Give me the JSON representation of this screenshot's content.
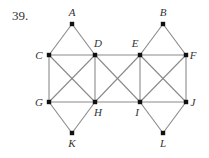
{
  "problem_number": "39.",
  "graph": {
    "edge_color": "#8a8a8a",
    "node_color": "#111111",
    "nodes": [
      {
        "id": "A",
        "x": 72,
        "y": 24,
        "lx": 72,
        "ly": 16
      },
      {
        "id": "B",
        "x": 163,
        "y": 24,
        "lx": 163,
        "ly": 16
      },
      {
        "id": "C",
        "x": 49,
        "y": 55,
        "lx": 39,
        "ly": 59
      },
      {
        "id": "D",
        "x": 95,
        "y": 55,
        "lx": 98,
        "ly": 47
      },
      {
        "id": "E",
        "x": 140,
        "y": 55,
        "lx": 135,
        "ly": 47
      },
      {
        "id": "F",
        "x": 186,
        "y": 55,
        "lx": 193,
        "ly": 59
      },
      {
        "id": "G",
        "x": 49,
        "y": 102,
        "lx": 39,
        "ly": 106
      },
      {
        "id": "H",
        "x": 95,
        "y": 102,
        "lx": 98,
        "ly": 116
      },
      {
        "id": "I",
        "x": 140,
        "y": 102,
        "lx": 137,
        "ly": 116
      },
      {
        "id": "J",
        "x": 186,
        "y": 102,
        "lx": 193,
        "ly": 106
      },
      {
        "id": "K",
        "x": 72,
        "y": 133,
        "lx": 72,
        "ly": 147
      },
      {
        "id": "L",
        "x": 163,
        "y": 133,
        "lx": 163,
        "ly": 147
      }
    ],
    "edges": [
      [
        "A",
        "C"
      ],
      [
        "A",
        "D"
      ],
      [
        "B",
        "E"
      ],
      [
        "B",
        "F"
      ],
      [
        "C",
        "D"
      ],
      [
        "D",
        "E"
      ],
      [
        "E",
        "F"
      ],
      [
        "G",
        "H"
      ],
      [
        "H",
        "I"
      ],
      [
        "I",
        "J"
      ],
      [
        "C",
        "G"
      ],
      [
        "D",
        "H"
      ],
      [
        "E",
        "I"
      ],
      [
        "F",
        "J"
      ],
      [
        "C",
        "H"
      ],
      [
        "D",
        "G"
      ],
      [
        "D",
        "I"
      ],
      [
        "E",
        "H"
      ],
      [
        "E",
        "J"
      ],
      [
        "F",
        "I"
      ],
      [
        "G",
        "K"
      ],
      [
        "H",
        "K"
      ],
      [
        "I",
        "L"
      ],
      [
        "J",
        "L"
      ]
    ]
  }
}
